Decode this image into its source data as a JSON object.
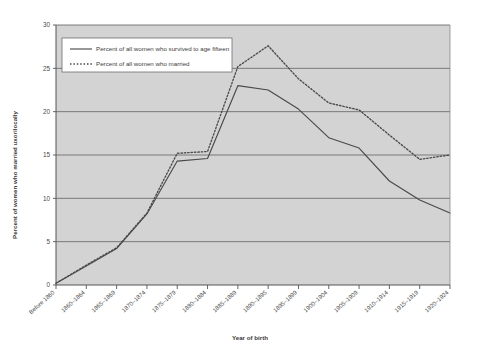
{
  "chart_data": {
    "type": "line",
    "title": "",
    "xlabel": "Year of birth",
    "ylabel": "Percent of women who married uxorilocally",
    "categories": [
      "Before 1860",
      "1860–1864",
      "1865–1869",
      "1870–1874",
      "1875–1879",
      "1880–1884",
      "1885–1889",
      "1890–1895",
      "1895–1899",
      "1900–1904",
      "1905–1909",
      "1910–1914",
      "1915–1919",
      "1920–1924"
    ],
    "series": [
      {
        "name": "Percent of all women who survived to age fifteen",
        "style": "solid",
        "color": "#4a4a4a",
        "values": [
          0.2,
          2.2,
          4.2,
          8.2,
          14.3,
          14.6,
          23.0,
          22.5,
          20.3,
          17.0,
          15.8,
          12.0,
          9.8,
          8.3
        ]
      },
      {
        "name": "Percent of all women who married",
        "style": "dotted",
        "color": "#4a4a4a",
        "values": [
          0.2,
          2.3,
          4.3,
          8.3,
          15.2,
          15.4,
          25.2,
          27.6,
          23.8,
          21.0,
          20.2,
          17.3,
          14.5,
          15.0
        ]
      }
    ],
    "ylim": [
      0,
      30
    ],
    "yticks": [
      0,
      5,
      10,
      15,
      20,
      25,
      30
    ],
    "ytick_labels": [
      "0",
      "5",
      "10",
      "15",
      "20",
      "25",
      "30"
    ],
    "grid": true,
    "grid_axis": "y",
    "legend_position": "upper-left-inside",
    "plot_background": "#d3d3d3",
    "grid_color": "#6e6e6e",
    "legend_background": "#ffffff",
    "figure_background": "#ffffff"
  },
  "legend": {
    "entries": [
      {
        "label": "Percent of all women who survived to age fifteen",
        "marker": "solid-line-swatch"
      },
      {
        "label": "Percent of all women who married",
        "marker": "dotted-line-swatch"
      }
    ]
  }
}
